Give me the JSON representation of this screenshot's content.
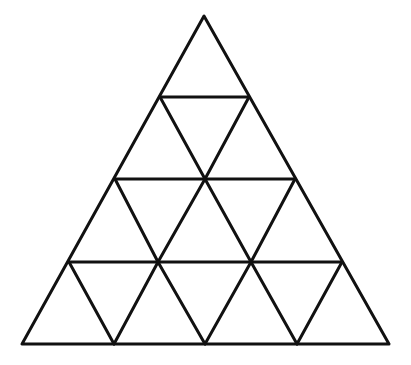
{
  "diagram": {
    "type": "subdivided-triangle",
    "rows": 4,
    "small_triangle_count": 16,
    "stroke_color": "#111111",
    "stroke_width": 3,
    "background_color": "#ffffff",
    "outer_triangle": {
      "apex": [
        204,
        16
      ],
      "bottom_left": [
        22,
        344
      ],
      "bottom_right": [
        389,
        344
      ]
    },
    "horizontal_lines": [
      {
        "y": 97,
        "x1": 160,
        "x2": 249
      },
      {
        "y": 179,
        "x1": 115,
        "x2": 295
      },
      {
        "y": 262,
        "x1": 69,
        "x2": 342
      }
    ],
    "interior_segments": [
      {
        "from": [
          160,
          97
        ],
        "to": [
          205,
          179
        ]
      },
      {
        "from": [
          249,
          97
        ],
        "to": [
          205,
          179
        ]
      },
      {
        "from": [
          115,
          179
        ],
        "to": [
          158,
          262
        ]
      },
      {
        "from": [
          205,
          179
        ],
        "to": [
          158,
          262
        ]
      },
      {
        "from": [
          205,
          179
        ],
        "to": [
          251,
          262
        ]
      },
      {
        "from": [
          295,
          179
        ],
        "to": [
          251,
          262
        ]
      },
      {
        "from": [
          69,
          262
        ],
        "to": [
          114,
          344
        ]
      },
      {
        "from": [
          158,
          262
        ],
        "to": [
          114,
          344
        ]
      },
      {
        "from": [
          158,
          262
        ],
        "to": [
          205,
          344
        ]
      },
      {
        "from": [
          251,
          262
        ],
        "to": [
          205,
          344
        ]
      },
      {
        "from": [
          251,
          262
        ],
        "to": [
          297,
          344
        ]
      },
      {
        "from": [
          342,
          262
        ],
        "to": [
          297,
          344
        ]
      }
    ]
  }
}
